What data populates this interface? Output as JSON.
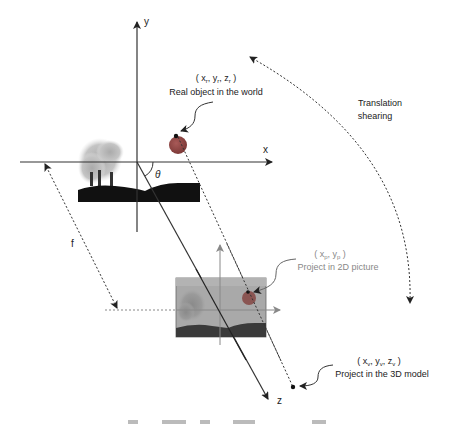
{
  "diagram": {
    "axes": {
      "x_label": "x",
      "y_label": "y",
      "z_label": "z",
      "angle_label": "θ",
      "focal_label": "f"
    },
    "real_object": {
      "coord_open": "( x",
      "coord_sub1": "r",
      "coord_mid1": ", y",
      "coord_sub2": "r",
      "coord_mid2": ", z",
      "coord_sub3": "r",
      "coord_close": " )",
      "caption": "Real object in the world"
    },
    "picture_projection": {
      "coord_open": "( x",
      "coord_sub1": "p",
      "coord_mid1": ", y",
      "coord_sub2": "p",
      "coord_close": " )",
      "caption": "Project in 2D picture"
    },
    "model_projection": {
      "coord_open": "( x",
      "coord_sub1": "v",
      "coord_mid1": ", y",
      "coord_sub2": "v",
      "coord_mid2": ", z",
      "coord_sub3": "v",
      "coord_close": " )",
      "caption": "Project in the 3D model"
    },
    "transform": {
      "line1": "Translation",
      "line2": "shearing"
    },
    "colors": {
      "axis": "#333333",
      "sphere": "#9a4a48",
      "ground": "#111111",
      "smoke": "#b8b8b8",
      "picture_bg": "#a6a6a6",
      "picture_ground": "#3a3a3a",
      "label_dark": "#222222",
      "label_gray": "#888888"
    }
  }
}
